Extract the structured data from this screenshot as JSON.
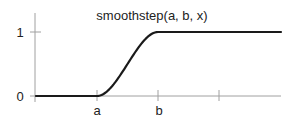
{
  "chart_data": {
    "type": "line",
    "title": "smoothstep(a, b, x)",
    "xlabel": "",
    "ylabel": "",
    "x_ticks": [
      {
        "label": "a",
        "value": 1
      },
      {
        "label": "b",
        "value": 2
      },
      {
        "label": "",
        "value": 3
      }
    ],
    "y_ticks": [
      {
        "label": "0",
        "value": 0
      },
      {
        "label": "1",
        "value": 1
      }
    ],
    "xlim": [
      -0.02,
      3.0
    ],
    "ylim": [
      0,
      1
    ],
    "grid": false,
    "legend": null,
    "series": [
      {
        "name": "smoothstep(a, b, x)",
        "function": "0 for x<=a; 3t^2-2t^3 with t=(x-a)/(b-a) for a<x<b; 1 for x>=b",
        "x": [
          0,
          0.5,
          1.0,
          1.125,
          1.25,
          1.375,
          1.5,
          1.625,
          1.75,
          1.875,
          2.0,
          2.5,
          3.0
        ],
        "values": [
          0,
          0,
          0,
          0.043,
          0.156,
          0.316,
          0.5,
          0.684,
          0.844,
          0.957,
          1,
          1,
          1
        ]
      }
    ],
    "colors": {
      "curve": "#1a1a1a",
      "axis": "#a0a0a0",
      "text": "#222222"
    }
  }
}
